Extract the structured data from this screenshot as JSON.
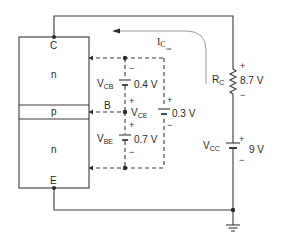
{
  "diagram": {
    "type": "circuit",
    "colors": {
      "line": "#3a3a3a",
      "background": "#ffffff"
    },
    "transistor": {
      "terminals": {
        "collector": "C",
        "base": "B",
        "emitter": "E"
      },
      "layers": [
        {
          "label": "n",
          "region": "collector"
        },
        {
          "label": "p",
          "region": "base"
        },
        {
          "label": "n",
          "region": "emitter"
        }
      ]
    },
    "current": {
      "symbol": "I",
      "sub1": "C",
      "sub2": "sat"
    },
    "voltages": {
      "vcb": {
        "symbol": "V",
        "sub": "CB",
        "value": "0.4 V",
        "top_sign": "−",
        "bottom_sign": "+"
      },
      "vce": {
        "symbol": "V",
        "sub": "CE",
        "value": "0.3 V",
        "top_sign": "+",
        "bottom_sign": "−"
      },
      "vbe": {
        "symbol": "V",
        "sub": "BE",
        "value": "0.7 V",
        "top_sign": "+",
        "bottom_sign": "−"
      }
    },
    "resistor": {
      "symbol": "R",
      "sub": "C",
      "value": "8.7 V",
      "top_sign": "+",
      "bottom_sign": "−"
    },
    "supply": {
      "symbol": "V",
      "sub": "CC",
      "value": "9 V",
      "top_sign": "+",
      "bottom_sign": "−"
    },
    "ground": {
      "icon": "ground-icon"
    }
  }
}
